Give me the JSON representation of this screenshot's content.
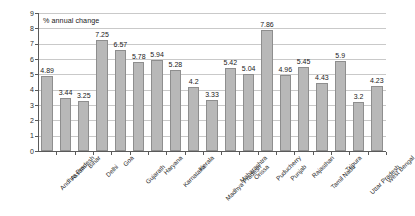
{
  "chart_data": {
    "type": "bar",
    "title": "% annual change",
    "xlabel": "",
    "ylabel": "",
    "ylim": [
      0,
      9
    ],
    "ytick_step": 1,
    "grid": true,
    "legend": false,
    "bar_color": "#b8b8b8",
    "bar_border_color": "#8e8e8e",
    "categories": [
      "Andhra Pradesh",
      "Assam",
      "Bihar",
      "Delhi",
      "Goa",
      "Gujarath",
      "Haryana",
      "Karnataka",
      "Kerala",
      "Madhya Pradesh",
      "Maharashtra",
      "Orissa",
      "Puducherry",
      "Punjab",
      "Rajasthan",
      "Tamil Nadu",
      "Tripura",
      "Uttar Pradesh",
      "West Bengal"
    ],
    "values": [
      4.89,
      3.44,
      3.25,
      7.25,
      6.57,
      5.78,
      5.94,
      5.28,
      4.2,
      3.33,
      5.42,
      5.04,
      7.86,
      4.96,
      5.45,
      4.43,
      5.9,
      3.2,
      4.23
    ],
    "value_labels": [
      "4.89",
      "3.44",
      "3.25",
      "7.25",
      "6.57",
      "5.78",
      "5.94",
      "5.28",
      "4.2",
      "3.33",
      "5.42",
      "5.04",
      "7.86",
      "4.96",
      "5.45",
      "4.43",
      "5.9",
      "3.2",
      "4.23"
    ],
    "ytick_labels": [
      "0",
      "1",
      "2",
      "3",
      "4",
      "5",
      "6",
      "7",
      "8",
      "9"
    ]
  }
}
